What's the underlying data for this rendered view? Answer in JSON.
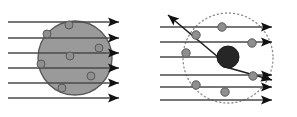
{
  "figure": {
    "background_color": "#ffffff",
    "width": 297,
    "height": 117
  },
  "colors": {
    "atom_fill": "#9a9a9a",
    "atom_stroke": "#595959",
    "electron_fill": "#8f8f8f",
    "electron_stroke": "#5a5a5a",
    "nucleus_fill": "#262626",
    "nucleus_stroke": "#1a1a1a",
    "ray_stroke": "#4a4a4a",
    "deflected_ray_stroke": "#1e1e1e",
    "arrow_fill": "#111111",
    "dotted_circle_stroke": "#8a8a8a"
  },
  "panels": [
    {
      "id": "thomson-panel",
      "name": "plum-pudding-model-panel",
      "label": "Thomson plum pudding model",
      "atom": {
        "name": "solid-atom-disc",
        "shape": "filled-circle",
        "cx": 75,
        "cy": 58,
        "r": 37,
        "fill": "#9a9a9a",
        "stroke": "#595959",
        "stroke_width": 1.4
      },
      "electrons": [
        {
          "cx": 69,
          "cy": 25,
          "r": 4.0
        },
        {
          "cx": 47,
          "cy": 34,
          "r": 4.0
        },
        {
          "cx": 99,
          "cy": 48,
          "r": 4.0
        },
        {
          "cx": 70,
          "cy": 56,
          "r": 4.0
        },
        {
          "cx": 41,
          "cy": 64,
          "r": 4.0
        },
        {
          "cx": 91,
          "cy": 76,
          "r": 4.0
        },
        {
          "cx": 62,
          "cy": 88,
          "r": 4.0
        }
      ],
      "rays": [
        {
          "x1": 8,
          "y1": 22,
          "x2": 119,
          "y2": 22
        },
        {
          "x1": 8,
          "y1": 38,
          "x2": 119,
          "y2": 38
        },
        {
          "x1": 8,
          "y1": 53,
          "x2": 119,
          "y2": 53
        },
        {
          "x1": 8,
          "y1": 68,
          "x2": 119,
          "y2": 68
        },
        {
          "x1": 8,
          "y1": 83,
          "x2": 119,
          "y2": 83
        },
        {
          "x1": 8,
          "y1": 98,
          "x2": 119,
          "y2": 98
        }
      ],
      "arrowheads": [
        {
          "x": 119,
          "y": 22,
          "angle": 0
        },
        {
          "x": 119,
          "y": 38,
          "angle": 0
        },
        {
          "x": 119,
          "y": 53,
          "angle": 0
        },
        {
          "x": 119,
          "y": 68,
          "angle": 0
        },
        {
          "x": 119,
          "y": 83,
          "angle": 0
        },
        {
          "x": 119,
          "y": 98,
          "angle": 0
        }
      ]
    },
    {
      "id": "rutherford-panel",
      "name": "nuclear-model-panel",
      "label": "Rutherford nuclear model",
      "atom_boundary": {
        "name": "dotted-atom-boundary",
        "shape": "dotted-circle",
        "cx": 228,
        "cy": 58,
        "r": 45,
        "stroke": "#8a8a8a",
        "stroke_width": 1.3,
        "dash": "1.1 3.0"
      },
      "nucleus": {
        "name": "nucleus",
        "cx": 228,
        "cy": 57,
        "r": 11,
        "fill": "#262626",
        "stroke": "#1a1a1a"
      },
      "electrons": [
        {
          "cx": 196,
          "cy": 35,
          "r": 4.2
        },
        {
          "cx": 222,
          "cy": 27,
          "r": 4.2
        },
        {
          "cx": 252,
          "cy": 43,
          "r": 4.2
        },
        {
          "cx": 186,
          "cy": 53,
          "r": 4.2
        },
        {
          "cx": 253,
          "cy": 76,
          "r": 4.2
        },
        {
          "cx": 196,
          "cy": 85,
          "r": 4.2
        },
        {
          "cx": 225,
          "cy": 92,
          "r": 4.2
        }
      ],
      "rays": [
        {
          "x1": 160,
          "y1": 27,
          "x2": 272,
          "y2": 27
        },
        {
          "x1": 160,
          "y1": 42,
          "x2": 272,
          "y2": 42
        },
        {
          "x1": 160,
          "y1": 57,
          "x2": 218,
          "y2": 57
        },
        {
          "x1": 160,
          "y1": 75,
          "x2": 272,
          "y2": 75
        },
        {
          "x1": 160,
          "y1": 87,
          "x2": 272,
          "y2": 87
        },
        {
          "x1": 160,
          "y1": 100,
          "x2": 272,
          "y2": 100
        }
      ],
      "deflected_rays": [
        {
          "name": "backscattered-ray",
          "points": "218,57 168,15",
          "arrow": {
            "x": 168,
            "y": 15,
            "angle": -140
          }
        },
        {
          "name": "small-angle-deflected-ray",
          "points": "222,66 272,80",
          "arrow": {
            "x": 272,
            "y": 80,
            "angle": 16
          }
        }
      ],
      "arrowheads": [
        {
          "x": 272,
          "y": 27,
          "angle": 0
        },
        {
          "x": 272,
          "y": 42,
          "angle": 0
        },
        {
          "x": 272,
          "y": 75,
          "angle": 0
        },
        {
          "x": 272,
          "y": 87,
          "angle": 0
        },
        {
          "x": 272,
          "y": 100,
          "angle": 0
        }
      ]
    }
  ]
}
